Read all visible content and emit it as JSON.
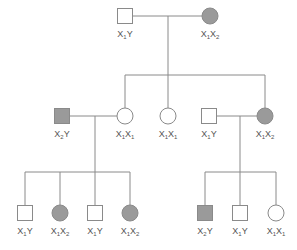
{
  "diagram": {
    "type": "pedigree",
    "colors": {
      "affected_fill": "#9a9a9a",
      "unaffected_fill": "#ffffff",
      "line": "#8a8a8a",
      "text": "#555555"
    },
    "individuals": [
      {
        "id": "g1-father",
        "sex": "male",
        "affected": false,
        "label": "X",
        "sub1": "1",
        "rest": "Y",
        "sub2": ""
      },
      {
        "id": "g1-mother",
        "sex": "female",
        "affected": true,
        "label": "X",
        "sub1": "1",
        "rest": "X",
        "sub2": "2"
      },
      {
        "id": "g2-husband-left",
        "sex": "male",
        "affected": true,
        "label": "X",
        "sub1": "2",
        "rest": "Y",
        "sub2": ""
      },
      {
        "id": "g2-daughter-1",
        "sex": "female",
        "affected": false,
        "label": "X",
        "sub1": "1",
        "rest": "X",
        "sub2": "1"
      },
      {
        "id": "g2-daughter-2",
        "sex": "female",
        "affected": false,
        "label": "X",
        "sub1": "1",
        "rest": "X",
        "sub2": "1"
      },
      {
        "id": "g2-husband-right",
        "sex": "male",
        "affected": false,
        "label": "X",
        "sub1": "1",
        "rest": "Y",
        "sub2": ""
      },
      {
        "id": "g2-daughter-3",
        "sex": "female",
        "affected": true,
        "label": "X",
        "sub1": "1",
        "rest": "X",
        "sub2": "2"
      },
      {
        "id": "g3-left-son-1",
        "sex": "male",
        "affected": false,
        "label": "X",
        "sub1": "1",
        "rest": "Y",
        "sub2": ""
      },
      {
        "id": "g3-left-daughter-1",
        "sex": "female",
        "affected": true,
        "label": "X",
        "sub1": "1",
        "rest": "X",
        "sub2": "2"
      },
      {
        "id": "g3-left-son-2",
        "sex": "male",
        "affected": false,
        "label": "X",
        "sub1": "1",
        "rest": "Y",
        "sub2": ""
      },
      {
        "id": "g3-left-daughter-2",
        "sex": "female",
        "affected": true,
        "label": "X",
        "sub1": "1",
        "rest": "X",
        "sub2": "2"
      },
      {
        "id": "g3-right-son-1",
        "sex": "male",
        "affected": true,
        "label": "X",
        "sub1": "2",
        "rest": "Y",
        "sub2": ""
      },
      {
        "id": "g3-right-son-2",
        "sex": "male",
        "affected": false,
        "label": "X",
        "sub1": "1",
        "rest": "Y",
        "sub2": ""
      },
      {
        "id": "g3-right-daughter",
        "sex": "female",
        "affected": false,
        "label": "X",
        "sub1": "1",
        "rest": "X",
        "sub2": "1"
      }
    ]
  }
}
